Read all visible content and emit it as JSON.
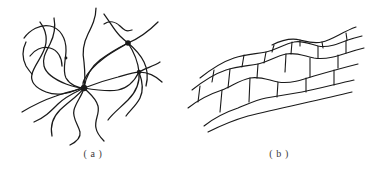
{
  "figure": {
    "type": "line-diagram",
    "background_color": "#ffffff",
    "stroke_color": "#1a1a1a",
    "caption_color": "#3a3a3a",
    "panels": [
      {
        "id": "a",
        "caption": "( a )",
        "subject": "amorphous-crosslinked-polymer-network",
        "description": "Tangled wavy polymer chains meeting at crosslink junction points",
        "chain_count": 11,
        "junction_count": 4,
        "junctions": [
          {
            "name": "junction-center",
            "x": 84,
            "y": 88,
            "radius": 3.2
          },
          {
            "name": "junction-upper-right",
            "x": 128,
            "y": 43,
            "radius": 2.8
          },
          {
            "name": "junction-mid-right",
            "x": 139,
            "y": 72,
            "radius": 2.4
          },
          {
            "name": "junction-upper-left",
            "x": 77,
            "y": 49,
            "radius": 1.8
          }
        ]
      },
      {
        "id": "b",
        "caption": "( b )",
        "subject": "lamellar-crystalline-brick-structure",
        "description": "Stacked wavy bands subdivided by staggered transverse walls, tilted upward to the right",
        "band_line_count": 6,
        "row_count": 3,
        "brick_divider_count": 16
      }
    ]
  }
}
